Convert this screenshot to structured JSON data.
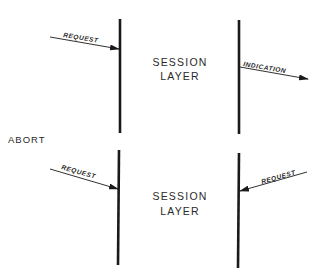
{
  "diagram": {
    "colors": {
      "ink": "#1a1a1a",
      "background": "#ffffff"
    },
    "side_label": "ABORT",
    "panels": [
      {
        "id": "top",
        "layer_label": [
          "SESSION",
          "LAYER"
        ],
        "left_arrow": {
          "label": "REQUEST",
          "direction": "into-layer"
        },
        "right_arrow": {
          "label": "INDICATION",
          "direction": "out-of-layer"
        }
      },
      {
        "id": "bottom",
        "layer_label": [
          "SESSION",
          "LAYER"
        ],
        "left_arrow": {
          "label": "REQUEST",
          "direction": "into-layer"
        },
        "right_arrow": {
          "label": "REQUEST",
          "direction": "into-layer"
        }
      }
    ]
  }
}
